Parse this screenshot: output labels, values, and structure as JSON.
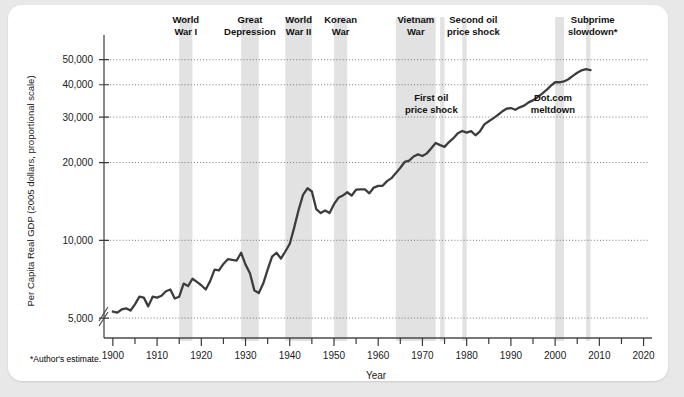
{
  "figure": {
    "footnote": "*Author's estimate."
  },
  "chart_data": {
    "type": "line",
    "title": "",
    "xlabel": "Year",
    "ylabel": "Per Capita Real GDP (2005 dollars, proportional scale)",
    "yscale": "log",
    "ylim": [
      4300,
      56000
    ],
    "xlim": [
      1898,
      2021
    ],
    "grid": true,
    "legend": "none",
    "axis_break": true,
    "yticks": [
      5000,
      10000,
      20000,
      30000,
      40000,
      50000
    ],
    "ytick_labels": [
      "5,000",
      "10,000",
      "20,000",
      "30,000",
      "40,000",
      "50,000"
    ],
    "xticks": [
      1900,
      1910,
      1920,
      1930,
      1940,
      1950,
      1960,
      1970,
      1980,
      1990,
      2000,
      2010,
      2020
    ],
    "xtick_labels": [
      "1900",
      "1910",
      "1920",
      "1930",
      "1940",
      "1950",
      "1960",
      "1970",
      "1980",
      "1990",
      "2000",
      "2010",
      "2020"
    ],
    "x_minor_ticks": [
      1905,
      1915,
      1925,
      1935,
      1945,
      1955,
      1965,
      1975,
      1985,
      1995,
      2005,
      2015
    ],
    "series": [
      {
        "name": "Per Capita Real GDP",
        "color": "#3d3d3d",
        "x": [
          1900,
          1901,
          1902,
          1903,
          1904,
          1905,
          1906,
          1907,
          1908,
          1909,
          1910,
          1911,
          1912,
          1913,
          1914,
          1915,
          1916,
          1917,
          1918,
          1919,
          1920,
          1921,
          1922,
          1923,
          1924,
          1925,
          1926,
          1927,
          1928,
          1929,
          1930,
          1931,
          1932,
          1933,
          1934,
          1935,
          1936,
          1937,
          1938,
          1939,
          1940,
          1941,
          1942,
          1943,
          1944,
          1945,
          1946,
          1947,
          1948,
          1949,
          1950,
          1951,
          1952,
          1953,
          1954,
          1955,
          1956,
          1957,
          1958,
          1959,
          1960,
          1961,
          1962,
          1963,
          1964,
          1965,
          1966,
          1967,
          1968,
          1969,
          1970,
          1971,
          1972,
          1973,
          1974,
          1975,
          1976,
          1977,
          1978,
          1979,
          1980,
          1981,
          1982,
          1983,
          1984,
          1985,
          1986,
          1987,
          1988,
          1989,
          1990,
          1991,
          1992,
          1993,
          1994,
          1995,
          1996,
          1997,
          1998,
          1999,
          2000,
          2001,
          2002,
          2003,
          2004,
          2005,
          2006,
          2007,
          2008
        ],
        "y": [
          5300,
          5250,
          5400,
          5450,
          5350,
          5650,
          6050,
          6000,
          5550,
          6050,
          6000,
          6100,
          6350,
          6450,
          5950,
          6050,
          6800,
          6650,
          7100,
          6900,
          6700,
          6450,
          6950,
          7700,
          7650,
          8100,
          8450,
          8400,
          8350,
          8950,
          8050,
          7450,
          6400,
          6250,
          6800,
          7700,
          8650,
          8950,
          8500,
          9050,
          9700,
          11200,
          13100,
          15000,
          15900,
          15450,
          13200,
          12750,
          13050,
          12750,
          13800,
          14600,
          14900,
          15350,
          14900,
          15700,
          15750,
          15750,
          15200,
          16000,
          16250,
          16250,
          16950,
          17400,
          18200,
          19100,
          20100,
          20350,
          21100,
          21500,
          21200,
          21700,
          22700,
          23800,
          23350,
          23000,
          24000,
          24850,
          25950,
          26500,
          26100,
          26450,
          25500,
          26400,
          28100,
          28900,
          29650,
          30500,
          31500,
          32300,
          32500,
          32000,
          32700,
          33200,
          34200,
          34800,
          35800,
          36900,
          38100,
          39600,
          40900,
          40900,
          41200,
          42000,
          43300,
          44500,
          45500,
          46000,
          45600
        ]
      }
    ],
    "bands": [
      {
        "label": "World\nWar I",
        "label_line1": "World",
        "label_line2": "War I",
        "start": 1915,
        "end": 1918,
        "color": "#e2e2e2"
      },
      {
        "label": "Great\nDepression",
        "label_line1": "Great",
        "label_line2": "Depression",
        "start": 1929,
        "end": 1933,
        "color": "#e2e2e2"
      },
      {
        "label": "World\nWar II",
        "label_line1": "World",
        "label_line2": "War II",
        "start": 1939,
        "end": 1945,
        "color": "#e2e2e2"
      },
      {
        "label": "Korean\nWar",
        "label_line1": "Korean",
        "label_line2": "War",
        "start": 1950,
        "end": 1953,
        "color": "#e2e2e2"
      },
      {
        "label": "Vietnam\nWar",
        "label_line1": "Vietnam",
        "label_line2": "War",
        "start": 1964,
        "end": 1973,
        "color": "#e2e2e2"
      },
      {
        "label": "First oil\nprice shock",
        "label_line1": "First oil",
        "label_line2": "price shock",
        "start": 1974,
        "end": 1975,
        "color": "#e2e2e2"
      },
      {
        "label": "Second oil\nprice shock",
        "label_line1": "Second oil",
        "label_line2": "price shock",
        "start": 1979,
        "end": 1980,
        "color": "#e2e2e2"
      },
      {
        "label": "Dot.com\nmeltdown",
        "label_line1": "Dot.com",
        "label_line2": "meltdown",
        "start": 2000,
        "end": 2002,
        "color": "#e2e2e2"
      },
      {
        "label": "Subprime\nslowdown*",
        "label_line1": "Subprime",
        "label_line2": "slowdown*",
        "start": 2007,
        "end": 2008,
        "color": "#e2e2e2"
      }
    ],
    "annotations": [
      {
        "name": "world-war-i",
        "line1": "World",
        "line2": "War I",
        "x": 1916.5,
        "placement": "top"
      },
      {
        "name": "great-depression",
        "line1": "Great",
        "line2": "Depression",
        "x": 1931.0,
        "placement": "top"
      },
      {
        "name": "world-war-ii",
        "line1": "World",
        "line2": "War II",
        "x": 1942.0,
        "placement": "top"
      },
      {
        "name": "korean-war",
        "line1": "Korean",
        "line2": "War",
        "x": 1951.5,
        "placement": "top"
      },
      {
        "name": "vietnam-war",
        "line1": "Vietnam",
        "line2": "War",
        "x": 1968.5,
        "placement": "top"
      },
      {
        "name": "second-oil-price-shock",
        "line1": "Second oil",
        "line2": "price shock",
        "x": 1981.5,
        "placement": "top"
      },
      {
        "name": "subprime-slowdown",
        "line1": "Subprime",
        "line2": "slowdown*",
        "x": 2008.5,
        "placement": "top"
      },
      {
        "name": "first-oil-price-shock",
        "line1": "First oil",
        "line2": "price shock",
        "x": 1972.0,
        "placement": "inner"
      },
      {
        "name": "dot-com-meltdown",
        "line1": "Dot.com",
        "line2": "meltdown",
        "x": 1999.5,
        "placement": "inner"
      }
    ]
  }
}
